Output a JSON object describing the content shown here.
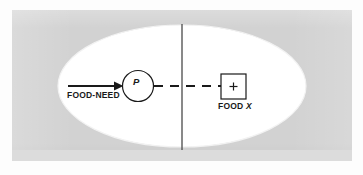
{
  "figure": {
    "type": "field-theory-diagram",
    "background_color": "#d2d2d2",
    "region_color": "#ffffff",
    "ink_color": "#1a1a1a",
    "life_space": {
      "name": "life-space-ellipse",
      "shape": "ellipse",
      "cx": 182,
      "cy": 86,
      "rx": 124,
      "ry": 61
    },
    "barrier": {
      "name": "barrier-line",
      "orientation": "vertical",
      "x": 182,
      "y_top": 24,
      "y_bottom": 150
    },
    "person": {
      "label": "P",
      "shape": "circle",
      "cx": 138,
      "cy": 86,
      "r": 16
    },
    "goal": {
      "label": "FOOD",
      "label_italic": "X",
      "valence": "+",
      "shape": "square",
      "x": 221,
      "y": 74,
      "size": 25
    },
    "need_arrow": {
      "label": "FOOD-NEED",
      "from_x": 68,
      "to_x": 122,
      "y": 86,
      "style": "solid",
      "head": "filled-triangle"
    },
    "path": {
      "name": "locomotion-path",
      "style": "dashed",
      "from_x": 154,
      "to_x": 221,
      "y": 86
    }
  },
  "labels": {
    "food_need": "FOOD-NEED",
    "person": "P",
    "goal_word": "FOOD",
    "goal_italic": "X",
    "valence_sign": "+"
  }
}
